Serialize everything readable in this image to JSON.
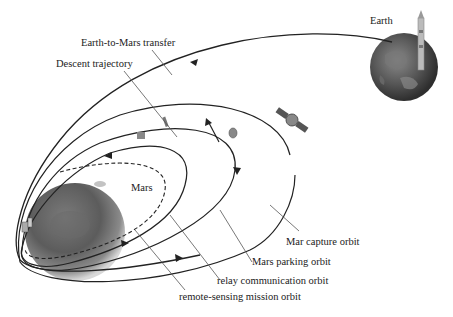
{
  "diagram": {
    "type": "mars-mission-orbit-diagram",
    "labels": {
      "earth": "Earth",
      "mars": "Mars",
      "earth_to_mars_transfer": "Earth-to-Mars transfer",
      "descent_trajectory": "Descent trajectory",
      "capture_orbit": "Mar capture orbit",
      "parking_orbit": "Mars parking orbit",
      "relay_orbit": "relay communication orbit",
      "remote_sensing_orbit": "remote-sensing mission orbit"
    },
    "nodes": [
      {
        "id": "earth",
        "label": "Earth",
        "icon": "planet-earth-icon"
      },
      {
        "id": "mars",
        "label": "Mars",
        "icon": "planet-mars-icon"
      },
      {
        "id": "rocket",
        "icon": "launch-rocket-icon"
      },
      {
        "id": "orbiter",
        "icon": "satellite-icon"
      },
      {
        "id": "lander",
        "icon": "lander-capsule-icon"
      }
    ],
    "edges": [
      {
        "from": "earth",
        "to": "mars",
        "label": "Earth-to-Mars transfer",
        "style": "solid-arrow"
      },
      {
        "from": "mars-orbit",
        "to": "mars-surface",
        "label": "Descent trajectory",
        "style": "solid"
      },
      {
        "label": "Mar capture orbit",
        "style": "solid-ellipse"
      },
      {
        "label": "Mars parking orbit",
        "style": "solid-ellipse"
      },
      {
        "label": "relay communication orbit",
        "style": "solid-ellipse"
      },
      {
        "label": "remote-sensing mission orbit",
        "style": "dashed-ellipse"
      }
    ],
    "colors": {
      "line": "#222222",
      "leader": "#555555",
      "mars": "#5a5a5a",
      "earth": "#4a4a4a",
      "background": "#ffffff"
    }
  }
}
